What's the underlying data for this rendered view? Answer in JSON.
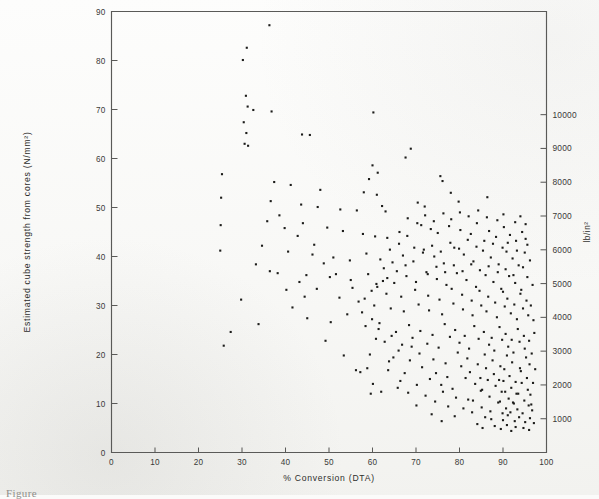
{
  "figure": {
    "kind": "scatter-plot",
    "caption_partial": "Figure",
    "ink_color": "#1c1c1a",
    "axis_color": "#5a5a58",
    "paper_color": "#fbfbfa"
  },
  "chart_data": {
    "type": "scatter",
    "title": "",
    "xlabel": "% Conversion (DTA)",
    "ylabel": "Estimated cube strength from cores (N/mm²)",
    "y2label": "lb/in²",
    "xlim": [
      0,
      100
    ],
    "ylim": [
      0,
      90
    ],
    "y2lim": [
      0,
      13053
    ],
    "xticks": [
      0,
      10,
      20,
      30,
      40,
      50,
      60,
      70,
      80,
      90,
      100
    ],
    "yticks": [
      0,
      10,
      20,
      30,
      40,
      50,
      60,
      70,
      80,
      90
    ],
    "y2ticks": [
      1000,
      2000,
      3000,
      4000,
      5000,
      6000,
      7000,
      8000,
      9000,
      10000
    ],
    "grid": false,
    "legend": null,
    "marker": "filled-square-dot",
    "marker_size_px": 2.1,
    "n_points": 352,
    "unit_conversion_note": "1000 lb/in² = 6.895 N/mm²",
    "points": [
      [
        36.3,
        87.2
      ],
      [
        31.1,
        82.6
      ],
      [
        30.2,
        80.1
      ],
      [
        30.9,
        72.8
      ],
      [
        31.3,
        70.6
      ],
      [
        32.6,
        69.9
      ],
      [
        36.8,
        69.6
      ],
      [
        60.2,
        69.4
      ],
      [
        30.4,
        67.4
      ],
      [
        31.0,
        65.2
      ],
      [
        30.6,
        63.0
      ],
      [
        31.4,
        62.6
      ],
      [
        43.8,
        64.9
      ],
      [
        45.6,
        64.8
      ],
      [
        68.8,
        62.0
      ],
      [
        67.6,
        60.2
      ],
      [
        60.0,
        58.6
      ],
      [
        61.2,
        57.1
      ],
      [
        25.4,
        56.8
      ],
      [
        59.2,
        55.8
      ],
      [
        37.4,
        55.2
      ],
      [
        41.2,
        54.6
      ],
      [
        48.0,
        53.6
      ],
      [
        58.0,
        53.1
      ],
      [
        61.0,
        52.6
      ],
      [
        75.6,
        56.4
      ],
      [
        76.1,
        55.4
      ],
      [
        78.0,
        53.0
      ],
      [
        25.2,
        52.0
      ],
      [
        36.6,
        51.3
      ],
      [
        43.6,
        50.6
      ],
      [
        47.4,
        50.1
      ],
      [
        52.6,
        49.6
      ],
      [
        56.4,
        49.4
      ],
      [
        62.2,
        50.3
      ],
      [
        63.0,
        49.2
      ],
      [
        70.4,
        51.0
      ],
      [
        72.0,
        50.2
      ],
      [
        79.8,
        51.2
      ],
      [
        86.4,
        52.1
      ],
      [
        25.1,
        46.4
      ],
      [
        35.8,
        47.2
      ],
      [
        44.0,
        46.8
      ],
      [
        49.6,
        45.9
      ],
      [
        53.2,
        45.2
      ],
      [
        57.8,
        44.6
      ],
      [
        60.6,
        44.1
      ],
      [
        63.4,
        43.8
      ],
      [
        66.2,
        45.0
      ],
      [
        68.0,
        44.2
      ],
      [
        71.2,
        46.4
      ],
      [
        73.4,
        45.6
      ],
      [
        75.0,
        44.8
      ],
      [
        77.6,
        46.2
      ],
      [
        80.2,
        45.4
      ],
      [
        82.6,
        44.6
      ],
      [
        84.0,
        46.8
      ],
      [
        86.8,
        45.2
      ],
      [
        88.4,
        44.0
      ],
      [
        90.2,
        46.0
      ],
      [
        91.6,
        44.4
      ],
      [
        93.0,
        43.2
      ],
      [
        94.4,
        45.0
      ],
      [
        95.2,
        43.6
      ],
      [
        25.0,
        41.2
      ],
      [
        40.6,
        41.0
      ],
      [
        46.2,
        40.4
      ],
      [
        51.0,
        39.8
      ],
      [
        54.8,
        39.2
      ],
      [
        58.6,
        40.6
      ],
      [
        61.8,
        39.4
      ],
      [
        64.6,
        38.8
      ],
      [
        67.0,
        40.2
      ],
      [
        69.4,
        39.0
      ],
      [
        71.8,
        41.4
      ],
      [
        74.2,
        40.0
      ],
      [
        76.4,
        38.6
      ],
      [
        78.8,
        41.8
      ],
      [
        81.0,
        40.4
      ],
      [
        83.2,
        39.0
      ],
      [
        85.4,
        41.2
      ],
      [
        87.2,
        39.8
      ],
      [
        89.0,
        38.4
      ],
      [
        90.8,
        41.0
      ],
      [
        92.2,
        39.6
      ],
      [
        93.6,
        38.2
      ],
      [
        95.0,
        40.8
      ],
      [
        96.2,
        39.2
      ],
      [
        36.4,
        37.0
      ],
      [
        38.2,
        36.6
      ],
      [
        44.8,
        36.2
      ],
      [
        50.2,
        35.8
      ],
      [
        55.0,
        35.2
      ],
      [
        59.0,
        36.4
      ],
      [
        62.4,
        35.0
      ],
      [
        65.0,
        34.6
      ],
      [
        67.8,
        36.0
      ],
      [
        70.0,
        34.8
      ],
      [
        72.4,
        36.8
      ],
      [
        74.8,
        35.4
      ],
      [
        77.0,
        34.2
      ],
      [
        79.4,
        36.6
      ],
      [
        81.6,
        35.2
      ],
      [
        83.8,
        33.8
      ],
      [
        86.0,
        36.2
      ],
      [
        87.8,
        34.8
      ],
      [
        89.6,
        33.4
      ],
      [
        91.4,
        36.0
      ],
      [
        92.8,
        34.6
      ],
      [
        94.2,
        33.2
      ],
      [
        95.6,
        35.8
      ],
      [
        96.8,
        34.2
      ],
      [
        59.8,
        33.0
      ],
      [
        63.2,
        32.4
      ],
      [
        66.6,
        31.8
      ],
      [
        69.8,
        33.2
      ],
      [
        72.8,
        32.0
      ],
      [
        75.4,
        31.2
      ],
      [
        78.2,
        33.4
      ],
      [
        80.6,
        32.2
      ],
      [
        82.8,
        31.0
      ],
      [
        84.6,
        33.0
      ],
      [
        86.6,
        31.8
      ],
      [
        88.2,
        30.6
      ],
      [
        90.0,
        32.8
      ],
      [
        91.0,
        31.4
      ],
      [
        92.6,
        30.2
      ],
      [
        94.0,
        32.4
      ],
      [
        95.4,
        31.0
      ],
      [
        96.4,
        30.0
      ],
      [
        52.4,
        31.6
      ],
      [
        56.8,
        30.8
      ],
      [
        60.4,
        30.0
      ],
      [
        64.2,
        29.4
      ],
      [
        67.2,
        28.8
      ],
      [
        70.6,
        30.2
      ],
      [
        73.0,
        29.0
      ],
      [
        76.0,
        28.2
      ],
      [
        78.6,
        30.4
      ],
      [
        80.8,
        29.2
      ],
      [
        83.0,
        28.0
      ],
      [
        85.0,
        30.0
      ],
      [
        86.2,
        28.8
      ],
      [
        88.6,
        27.6
      ],
      [
        90.4,
        29.8
      ],
      [
        91.8,
        28.4
      ],
      [
        93.2,
        27.2
      ],
      [
        94.6,
        29.4
      ],
      [
        95.8,
        28.0
      ],
      [
        97.0,
        27.0
      ],
      [
        33.8,
        26.2
      ],
      [
        58.4,
        25.8
      ],
      [
        61.4,
        25.2
      ],
      [
        65.4,
        24.6
      ],
      [
        68.4,
        26.0
      ],
      [
        71.0,
        24.8
      ],
      [
        73.8,
        24.0
      ],
      [
        76.6,
        26.2
      ],
      [
        79.0,
        25.0
      ],
      [
        81.2,
        23.8
      ],
      [
        83.4,
        25.8
      ],
      [
        85.6,
        24.6
      ],
      [
        87.4,
        23.4
      ],
      [
        89.2,
        25.6
      ],
      [
        90.6,
        24.2
      ],
      [
        92.0,
        23.0
      ],
      [
        93.4,
        25.2
      ],
      [
        94.8,
        23.8
      ],
      [
        96.0,
        22.8
      ],
      [
        97.2,
        24.4
      ],
      [
        60.8,
        23.2
      ],
      [
        62.8,
        22.6
      ],
      [
        66.8,
        22.0
      ],
      [
        69.2,
        23.4
      ],
      [
        72.6,
        22.2
      ],
      [
        75.2,
        21.4
      ],
      [
        77.8,
        23.6
      ],
      [
        80.0,
        22.4
      ],
      [
        82.2,
        21.2
      ],
      [
        84.4,
        23.2
      ],
      [
        86.8,
        22.0
      ],
      [
        88.0,
        20.8
      ],
      [
        89.8,
        23.0
      ],
      [
        91.2,
        21.6
      ],
      [
        92.4,
        20.4
      ],
      [
        93.8,
        22.6
      ],
      [
        95.0,
        21.2
      ],
      [
        96.6,
        20.2
      ],
      [
        59.4,
        20.0
      ],
      [
        64.8,
        19.4
      ],
      [
        68.6,
        18.8
      ],
      [
        70.8,
        20.2
      ],
      [
        74.0,
        19.0
      ],
      [
        76.8,
        18.2
      ],
      [
        79.6,
        20.4
      ],
      [
        81.8,
        19.2
      ],
      [
        84.2,
        18.0
      ],
      [
        85.8,
        20.0
      ],
      [
        87.6,
        18.8
      ],
      [
        89.4,
        17.6
      ],
      [
        90.9,
        19.8
      ],
      [
        92.1,
        18.4
      ],
      [
        93.9,
        17.2
      ],
      [
        95.3,
        19.4
      ],
      [
        96.1,
        18.0
      ],
      [
        97.4,
        17.0
      ],
      [
        57.2,
        16.4
      ],
      [
        63.6,
        16.8
      ],
      [
        67.4,
        16.2
      ],
      [
        71.4,
        17.4
      ],
      [
        74.6,
        16.2
      ],
      [
        77.2,
        15.4
      ],
      [
        80.4,
        17.6
      ],
      [
        82.4,
        16.4
      ],
      [
        84.8,
        15.2
      ],
      [
        86.1,
        17.2
      ],
      [
        87.9,
        16.0
      ],
      [
        89.1,
        14.8
      ],
      [
        90.3,
        17.0
      ],
      [
        91.5,
        15.6
      ],
      [
        92.9,
        14.4
      ],
      [
        94.1,
        16.6
      ],
      [
        95.5,
        15.2
      ],
      [
        96.9,
        14.2
      ],
      [
        60.1,
        14.0
      ],
      [
        66.4,
        14.6
      ],
      [
        70.2,
        13.8
      ],
      [
        73.2,
        15.0
      ],
      [
        75.8,
        13.8
      ],
      [
        78.4,
        13.0
      ],
      [
        81.4,
        15.2
      ],
      [
        83.6,
        14.0
      ],
      [
        85.2,
        12.8
      ],
      [
        86.5,
        14.8
      ],
      [
        88.3,
        13.6
      ],
      [
        89.7,
        12.4
      ],
      [
        90.1,
        14.6
      ],
      [
        91.9,
        13.2
      ],
      [
        93.1,
        12.0
      ],
      [
        94.3,
        14.2
      ],
      [
        95.7,
        12.8
      ],
      [
        96.3,
        11.8
      ],
      [
        68.2,
        12.2
      ],
      [
        72.2,
        11.6
      ],
      [
        76.2,
        12.4
      ],
      [
        79.2,
        11.2
      ],
      [
        82.0,
        10.8
      ],
      [
        84.9,
        12.6
      ],
      [
        86.9,
        11.4
      ],
      [
        88.9,
        10.2
      ],
      [
        90.5,
        12.4
      ],
      [
        91.3,
        11.0
      ],
      [
        92.5,
        10.0
      ],
      [
        93.5,
        12.0
      ],
      [
        94.9,
        10.6
      ],
      [
        96.5,
        9.8
      ],
      [
        70.1,
        9.6
      ],
      [
        74.4,
        10.4
      ],
      [
        77.4,
        9.4
      ],
      [
        80.9,
        9.0
      ],
      [
        83.1,
        10.6
      ],
      [
        85.1,
        9.2
      ],
      [
        87.1,
        8.4
      ],
      [
        89.3,
        10.4
      ],
      [
        90.7,
        9.0
      ],
      [
        91.7,
        8.2
      ],
      [
        92.3,
        10.2
      ],
      [
        93.3,
        8.8
      ],
      [
        94.5,
        8.0
      ],
      [
        95.9,
        9.6
      ],
      [
        96.7,
        8.6
      ],
      [
        73.6,
        7.8
      ],
      [
        78.9,
        7.4
      ],
      [
        82.9,
        8.2
      ],
      [
        85.9,
        7.2
      ],
      [
        87.3,
        6.8
      ],
      [
        89.9,
        8.0
      ],
      [
        90.0,
        6.6
      ],
      [
        91.1,
        7.6
      ],
      [
        92.7,
        6.4
      ],
      [
        93.7,
        7.2
      ],
      [
        95.1,
        6.2
      ],
      [
        96.2,
        7.0
      ],
      [
        97.1,
        6.0
      ],
      [
        75.9,
        6.4
      ],
      [
        84.1,
        5.8
      ],
      [
        88.1,
        5.4
      ],
      [
        90.9,
        5.6
      ],
      [
        92.9,
        5.2
      ],
      [
        94.7,
        5.0
      ],
      [
        96.0,
        4.6
      ],
      [
        85.3,
        5.0
      ],
      [
        89.5,
        4.8
      ],
      [
        91.9,
        4.4
      ],
      [
        59.6,
        12.0
      ],
      [
        62.0,
        12.4
      ],
      [
        65.8,
        13.2
      ],
      [
        58.8,
        17.2
      ],
      [
        56.2,
        16.8
      ],
      [
        63.8,
        18.6
      ],
      [
        66.0,
        20.8
      ],
      [
        69.0,
        21.6
      ],
      [
        64.4,
        23.8
      ],
      [
        61.6,
        26.4
      ],
      [
        59.9,
        27.2
      ],
      [
        57.6,
        28.6
      ],
      [
        55.4,
        33.6
      ],
      [
        51.6,
        36.4
      ],
      [
        48.8,
        38.6
      ],
      [
        46.6,
        42.4
      ],
      [
        42.8,
        44.2
      ],
      [
        39.8,
        45.8
      ],
      [
        38.6,
        48.4
      ],
      [
        34.6,
        42.2
      ],
      [
        33.2,
        38.4
      ],
      [
        29.8,
        31.2
      ],
      [
        27.4,
        24.6
      ],
      [
        25.8,
        21.8
      ],
      [
        86.3,
        48.0
      ],
      [
        88.7,
        47.4
      ],
      [
        90.1,
        48.6
      ],
      [
        92.8,
        47.0
      ],
      [
        94.0,
        48.2
      ],
      [
        95.2,
        46.6
      ],
      [
        84.3,
        49.4
      ],
      [
        82.1,
        48.2
      ],
      [
        80.1,
        49.0
      ],
      [
        78.1,
        47.6
      ],
      [
        76.3,
        48.8
      ],
      [
        74.1,
        47.2
      ],
      [
        72.1,
        48.4
      ],
      [
        70.3,
        46.8
      ],
      [
        68.1,
        47.8
      ],
      [
        66.1,
        42.6
      ],
      [
        64.0,
        41.4
      ],
      [
        62.6,
        37.6
      ],
      [
        60.9,
        34.4
      ],
      [
        58.2,
        31.4
      ],
      [
        54.2,
        28.2
      ],
      [
        50.4,
        26.6
      ],
      [
        47.2,
        33.4
      ],
      [
        44.4,
        31.8
      ],
      [
        41.6,
        29.6
      ],
      [
        45.0,
        27.4
      ],
      [
        49.2,
        22.8
      ],
      [
        53.4,
        19.8
      ],
      [
        43.2,
        34.8
      ],
      [
        40.2,
        33.2
      ],
      [
        87.7,
        42.6
      ],
      [
        89.9,
        41.8
      ],
      [
        91.1,
        42.8
      ],
      [
        93.2,
        41.2
      ],
      [
        95.6,
        42.4
      ],
      [
        85.7,
        43.2
      ],
      [
        83.9,
        42.0
      ],
      [
        81.9,
        43.4
      ],
      [
        79.9,
        41.6
      ],
      [
        77.9,
        42.8
      ],
      [
        75.7,
        41.0
      ],
      [
        73.7,
        42.2
      ],
      [
        71.6,
        40.8
      ],
      [
        69.6,
        41.8
      ],
      [
        67.6,
        38.2
      ],
      [
        65.6,
        37.0
      ],
      [
        63.4,
        35.6
      ],
      [
        61.1,
        33.8
      ],
      [
        90.6,
        37.4
      ],
      [
        92.4,
        36.2
      ],
      [
        94.6,
        37.8
      ],
      [
        88.8,
        36.8
      ],
      [
        86.7,
        38.0
      ],
      [
        84.7,
        37.2
      ],
      [
        82.7,
        38.4
      ],
      [
        80.7,
        37.0
      ],
      [
        78.7,
        38.2
      ],
      [
        76.7,
        36.8
      ],
      [
        74.7,
        37.9
      ],
      [
        72.7,
        36.4
      ]
    ]
  }
}
